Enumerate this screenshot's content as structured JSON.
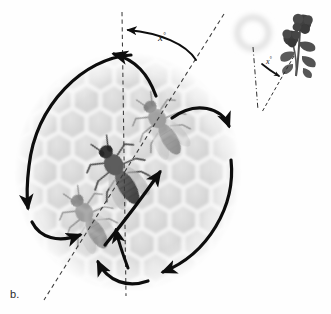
{
  "figure": {
    "panel_label": "b.",
    "title_semantic": "honeybee-waggle-dance-diagram",
    "background_color": "#ffffff"
  },
  "comb": {
    "name": "honeycomb-substrate",
    "cell_fill": "#d9d9d9",
    "cell_border": "#f4f4f4",
    "center_x": 128,
    "center_y": 172,
    "radius_x": 112,
    "radius_y": 118,
    "cell_radius": 16,
    "rows": 9,
    "cols": 9
  },
  "axes": {
    "gravity_line": {
      "name": "vertical-gravity-reference-line",
      "style": "dashed",
      "color": "#3a3a3a",
      "x1": 122,
      "y1": 12,
      "x2": 126,
      "y2": 296
    },
    "waggle_line": {
      "name": "waggle-run-direction-line",
      "style": "dashed",
      "color": "#3a3a3a",
      "x1": 224,
      "y1": 14,
      "x2": 44,
      "y2": 300
    }
  },
  "angle": {
    "main_label": "x",
    "degree_symbol": "°",
    "description": "angle-between-gravity-and-waggle-run",
    "label_x": 158,
    "label_y": 40
  },
  "bees": [
    {
      "name": "bee-center-waggle-run",
      "tone": "dark",
      "x": 120,
      "y": 175,
      "rotation": -31,
      "scale": 1.0,
      "opacity": 0.95
    },
    {
      "name": "bee-ghost-upper-right",
      "tone": "light",
      "x": 163,
      "y": 128,
      "rotation": -31,
      "scale": 0.92,
      "opacity": 0.45
    },
    {
      "name": "bee-ghost-lower-left",
      "tone": "light",
      "x": 90,
      "y": 222,
      "rotation": -31,
      "scale": 0.92,
      "opacity": 0.45
    }
  ],
  "dance_arrows": [
    {
      "name": "dance-arc-left-loop-descending",
      "direction": "down-left"
    },
    {
      "name": "dance-arc-left-loop-bottom-return",
      "direction": "right"
    },
    {
      "name": "dance-arc-right-loop-descending",
      "direction": "down-right"
    },
    {
      "name": "dance-arc-right-loop-bottom-return",
      "direction": "left"
    },
    {
      "name": "dance-arc-top-return-to-start",
      "direction": "left"
    },
    {
      "name": "dance-arc-bottom-return-to-start",
      "direction": "up"
    },
    {
      "name": "waggle-run-arrow-upward",
      "direction": "up-right"
    }
  ],
  "inset": {
    "name": "sun-and-flower-reference-inset",
    "sun": {
      "name": "sun-glow",
      "cx": 253,
      "cy": 33,
      "r": 20,
      "color": "#e8e8e8"
    },
    "flower": {
      "name": "flower-cluster",
      "cx": 300,
      "cy": 42,
      "color": "#4a4a4a"
    },
    "vertical_line": {
      "name": "inset-vertical-reference-line",
      "style": "dash-dot",
      "x1": 253,
      "y1": 48,
      "x2": 258,
      "y2": 110
    },
    "flower_line": {
      "name": "inset-direction-to-flower-line",
      "style": "dashed",
      "x1": 292,
      "y1": 55,
      "x2": 262,
      "y2": 112
    },
    "angle_label": "x",
    "degree_symbol": "°",
    "label_x": 269,
    "label_y": 70
  }
}
